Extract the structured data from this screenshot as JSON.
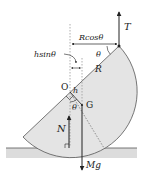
{
  "labels": {
    "tension": "T",
    "rcos": "Rcosθ",
    "hsin": "hsinθ",
    "theta_top": "θ",
    "radius": "R",
    "origin": "O",
    "h": "h",
    "theta_mid": "θ",
    "centroid": "G",
    "normal": "N",
    "weight": "Mg"
  },
  "colors": {
    "fill": "#e4e4e4",
    "ground": "#dcdcdc",
    "line": "#222222",
    "dotted": "#999999"
  }
}
